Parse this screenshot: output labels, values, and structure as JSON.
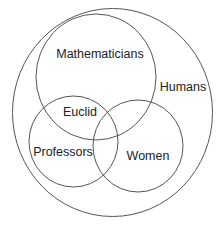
{
  "diagram": {
    "type": "venn",
    "stroke_color": "#555555",
    "text_color": "#222222",
    "sets": [
      {
        "id": "humans",
        "label": "Humans",
        "cx": 112.5,
        "cy": 112.5,
        "rx": 100,
        "ry": 104,
        "label_x": 183,
        "label_y": 91
      },
      {
        "id": "mathematicians",
        "label": "Mathematicians",
        "cx": 96,
        "cy": 77,
        "rx": 60,
        "ry": 63,
        "label_x": 100,
        "label_y": 58
      },
      {
        "id": "professors",
        "label": "Professors",
        "cx": 73.5,
        "cy": 141.5,
        "rx": 44.5,
        "ry": 45.5,
        "label_x": 63,
        "label_y": 156
      },
      {
        "id": "women",
        "label": "Women",
        "cx": 138,
        "cy": 146,
        "rx": 45,
        "ry": 46,
        "label_x": 148,
        "label_y": 160
      }
    ],
    "annotations": [
      {
        "id": "euclid",
        "label": "Euclid",
        "x": 80,
        "y": 116,
        "region": "mathematicians ∩ professors"
      }
    ]
  }
}
